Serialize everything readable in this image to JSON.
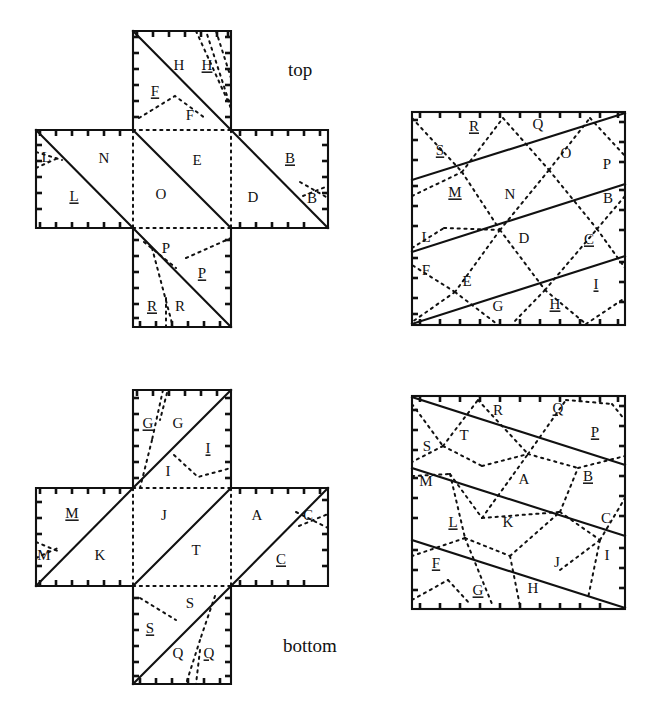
{
  "figure": {
    "caption_top": "top",
    "caption_bottom": "bottom",
    "colors": {
      "ink": "#111111",
      "background": "#ffffff"
    },
    "line_styles": {
      "solid": "cut-or-edge",
      "dotted": "fold-crease",
      "tick": "boundary-hatch"
    }
  },
  "panels": [
    {
      "id": "top-left-cross",
      "name": "cube-net-top",
      "shape": "cross",
      "caption": "top",
      "labels": [
        {
          "text": "H",
          "underline": false,
          "x": 179,
          "y": 67
        },
        {
          "text": "H",
          "underline": true,
          "x": 207,
          "y": 67
        },
        {
          "text": "F",
          "underline": true,
          "x": 155,
          "y": 93
        },
        {
          "text": "F",
          "underline": false,
          "x": 190,
          "y": 117
        },
        {
          "text": "L",
          "underline": false,
          "x": 46,
          "y": 159
        },
        {
          "text": "N",
          "underline": false,
          "x": 104,
          "y": 160
        },
        {
          "text": "E",
          "underline": false,
          "x": 197,
          "y": 162
        },
        {
          "text": "B",
          "underline": true,
          "x": 290,
          "y": 160
        },
        {
          "text": "L",
          "underline": true,
          "x": 74,
          "y": 198
        },
        {
          "text": "O",
          "underline": false,
          "x": 161,
          "y": 196
        },
        {
          "text": "D",
          "underline": false,
          "x": 253,
          "y": 199
        },
        {
          "text": "B",
          "underline": false,
          "x": 312,
          "y": 200
        },
        {
          "text": "P",
          "underline": false,
          "x": 166,
          "y": 250
        },
        {
          "text": "P",
          "underline": true,
          "x": 202,
          "y": 275
        },
        {
          "text": "R",
          "underline": true,
          "x": 152,
          "y": 308
        },
        {
          "text": "R",
          "underline": false,
          "x": 180,
          "y": 308
        }
      ]
    },
    {
      "id": "top-right-square",
      "name": "square-tiling-top",
      "shape": "square",
      "labels": [
        {
          "text": "R",
          "underline": true,
          "x": 474,
          "y": 128
        },
        {
          "text": "Q",
          "underline": false,
          "x": 538,
          "y": 126
        },
        {
          "text": "S",
          "underline": true,
          "x": 440,
          "y": 152
        },
        {
          "text": "O",
          "underline": false,
          "x": 566,
          "y": 155
        },
        {
          "text": "P",
          "underline": false,
          "x": 607,
          "y": 166
        },
        {
          "text": "M",
          "underline": true,
          "x": 455,
          "y": 194
        },
        {
          "text": "N",
          "underline": false,
          "x": 510,
          "y": 196
        },
        {
          "text": "B",
          "underline": false,
          "x": 608,
          "y": 200
        },
        {
          "text": "L",
          "underline": false,
          "x": 426,
          "y": 239
        },
        {
          "text": "D",
          "underline": false,
          "x": 524,
          "y": 240
        },
        {
          "text": "C",
          "underline": true,
          "x": 589,
          "y": 241
        },
        {
          "text": "F",
          "underline": false,
          "x": 426,
          "y": 272
        },
        {
          "text": "E",
          "underline": false,
          "x": 467,
          "y": 283
        },
        {
          "text": "I",
          "underline": true,
          "x": 596,
          "y": 286
        },
        {
          "text": "G",
          "underline": false,
          "x": 498,
          "y": 308
        },
        {
          "text": "H",
          "underline": true,
          "x": 555,
          "y": 306
        }
      ]
    },
    {
      "id": "bottom-left-cross",
      "name": "cube-net-bottom",
      "shape": "cross",
      "caption": "bottom",
      "labels": [
        {
          "text": "G",
          "underline": true,
          "x": 148,
          "y": 425
        },
        {
          "text": "G",
          "underline": false,
          "x": 178,
          "y": 425
        },
        {
          "text": "I",
          "underline": true,
          "x": 208,
          "y": 450
        },
        {
          "text": "I",
          "underline": false,
          "x": 168,
          "y": 473
        },
        {
          "text": "M",
          "underline": true,
          "x": 72,
          "y": 515
        },
        {
          "text": "J",
          "underline": false,
          "x": 164,
          "y": 517
        },
        {
          "text": "A",
          "underline": false,
          "x": 257,
          "y": 517
        },
        {
          "text": "C",
          "underline": false,
          "x": 308,
          "y": 517
        },
        {
          "text": "M",
          "underline": false,
          "x": 44,
          "y": 557
        },
        {
          "text": "K",
          "underline": false,
          "x": 100,
          "y": 557
        },
        {
          "text": "T",
          "underline": false,
          "x": 196,
          "y": 552
        },
        {
          "text": "C",
          "underline": true,
          "x": 281,
          "y": 561
        },
        {
          "text": "S",
          "underline": false,
          "x": 190,
          "y": 605
        },
        {
          "text": "S",
          "underline": true,
          "x": 150,
          "y": 630
        },
        {
          "text": "Q",
          "underline": false,
          "x": 178,
          "y": 655
        },
        {
          "text": "Q",
          "underline": true,
          "x": 209,
          "y": 655
        }
      ]
    },
    {
      "id": "bottom-right-square",
      "name": "square-tiling-bottom",
      "shape": "square",
      "labels": [
        {
          "text": "R",
          "underline": false,
          "x": 498,
          "y": 412
        },
        {
          "text": "Q",
          "underline": true,
          "x": 558,
          "y": 410
        },
        {
          "text": "T",
          "underline": false,
          "x": 464,
          "y": 437
        },
        {
          "text": "P",
          "underline": true,
          "x": 595,
          "y": 434
        },
        {
          "text": "S",
          "underline": false,
          "x": 427,
          "y": 448
        },
        {
          "text": "M",
          "underline": false,
          "x": 426,
          "y": 483
        },
        {
          "text": "A",
          "underline": false,
          "x": 524,
          "y": 481
        },
        {
          "text": "B",
          "underline": true,
          "x": 588,
          "y": 478
        },
        {
          "text": "L",
          "underline": true,
          "x": 453,
          "y": 524
        },
        {
          "text": "K",
          "underline": false,
          "x": 508,
          "y": 524
        },
        {
          "text": "C",
          "underline": false,
          "x": 606,
          "y": 520
        },
        {
          "text": "I",
          "underline": false,
          "x": 607,
          "y": 557
        },
        {
          "text": "F",
          "underline": true,
          "x": 436,
          "y": 565
        },
        {
          "text": "J",
          "underline": false,
          "x": 557,
          "y": 564
        },
        {
          "text": "G",
          "underline": true,
          "x": 478,
          "y": 592
        },
        {
          "text": "H",
          "underline": false,
          "x": 533,
          "y": 590
        }
      ]
    }
  ]
}
